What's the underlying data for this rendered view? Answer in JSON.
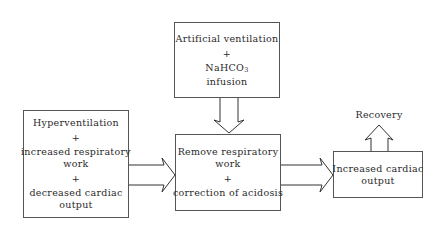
{
  "diagram": {
    "type": "flowchart",
    "nodes": {
      "left": {
        "lines": [
          "Hyperventilation",
          "+",
          "increased respiratory",
          "work",
          "+",
          "decreased cardiac",
          "output"
        ]
      },
      "top": {
        "line1": "Artificial ventilation",
        "plus": "+",
        "line2_main": "NaHCO",
        "line2_sub": "3",
        "line3": "infusion"
      },
      "middle": {
        "lines": [
          "Remove respiratory",
          "work",
          "+",
          "correction of acidosis"
        ]
      },
      "right": {
        "lines": [
          "Increased cardiac",
          "output"
        ]
      },
      "outcome": {
        "label": "Recovery"
      }
    },
    "edges": [
      {
        "from": "left",
        "to": "middle",
        "style": "block-arrow"
      },
      {
        "from": "top",
        "to": "middle",
        "style": "block-arrow"
      },
      {
        "from": "middle",
        "to": "right",
        "style": "block-arrow"
      },
      {
        "from": "right",
        "to": "outcome",
        "style": "block-arrow"
      }
    ]
  }
}
